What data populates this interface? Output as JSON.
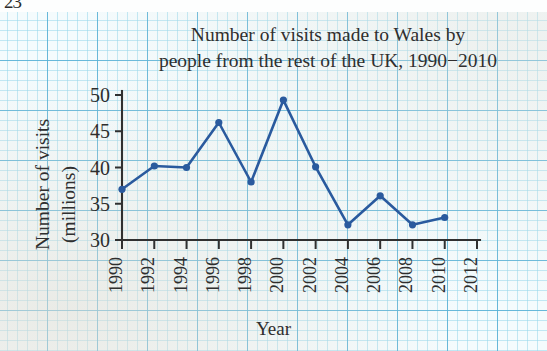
{
  "page_number": "23",
  "chart_data": {
    "type": "line",
    "title": "Number of visits made to Wales by people from the rest of the UK, 1990−2010",
    "title_line1": "Number of visits made to Wales by",
    "title_line2": "people from the rest of the UK, 1990−2010",
    "xlabel": "Year",
    "ylabel": "Number of visits (millions)",
    "ylabel_line1": "Number of visits",
    "ylabel_line2": "(millions)",
    "x": [
      1990,
      1992,
      1994,
      1996,
      1998,
      2000,
      2002,
      2004,
      2006,
      2008,
      2010
    ],
    "values": [
      37.0,
      40.2,
      40.0,
      46.2,
      38.0,
      49.3,
      40.1,
      32.1,
      36.1,
      32.1,
      33.1
    ],
    "xticks": [
      "1990",
      "1992",
      "1994",
      "1996",
      "1998",
      "2000",
      "2002",
      "2004",
      "2006",
      "2008",
      "2010",
      "2012"
    ],
    "xtick_values": [
      1990,
      1992,
      1994,
      1996,
      1998,
      2000,
      2002,
      2004,
      2006,
      2008,
      2010,
      2012
    ],
    "yticks": [
      "30",
      "35",
      "40",
      "45",
      "50"
    ],
    "ytick_values": [
      30,
      35,
      40,
      45,
      50
    ],
    "xlim": [
      1990,
      2012
    ],
    "ylim": [
      30,
      50
    ],
    "grid": true,
    "grid_style": "graph-paper",
    "legend": null,
    "marker": "circle",
    "series_color": "#2a5a9e",
    "colors": {
      "line": "#2a5a9e",
      "marker": "#2a5a9e",
      "axis": "#303030",
      "text": "#2f2f2f",
      "paper": "#f4fbfd",
      "grid_minor": "#96d7eb",
      "grid_major": "#56b0d5"
    }
  }
}
